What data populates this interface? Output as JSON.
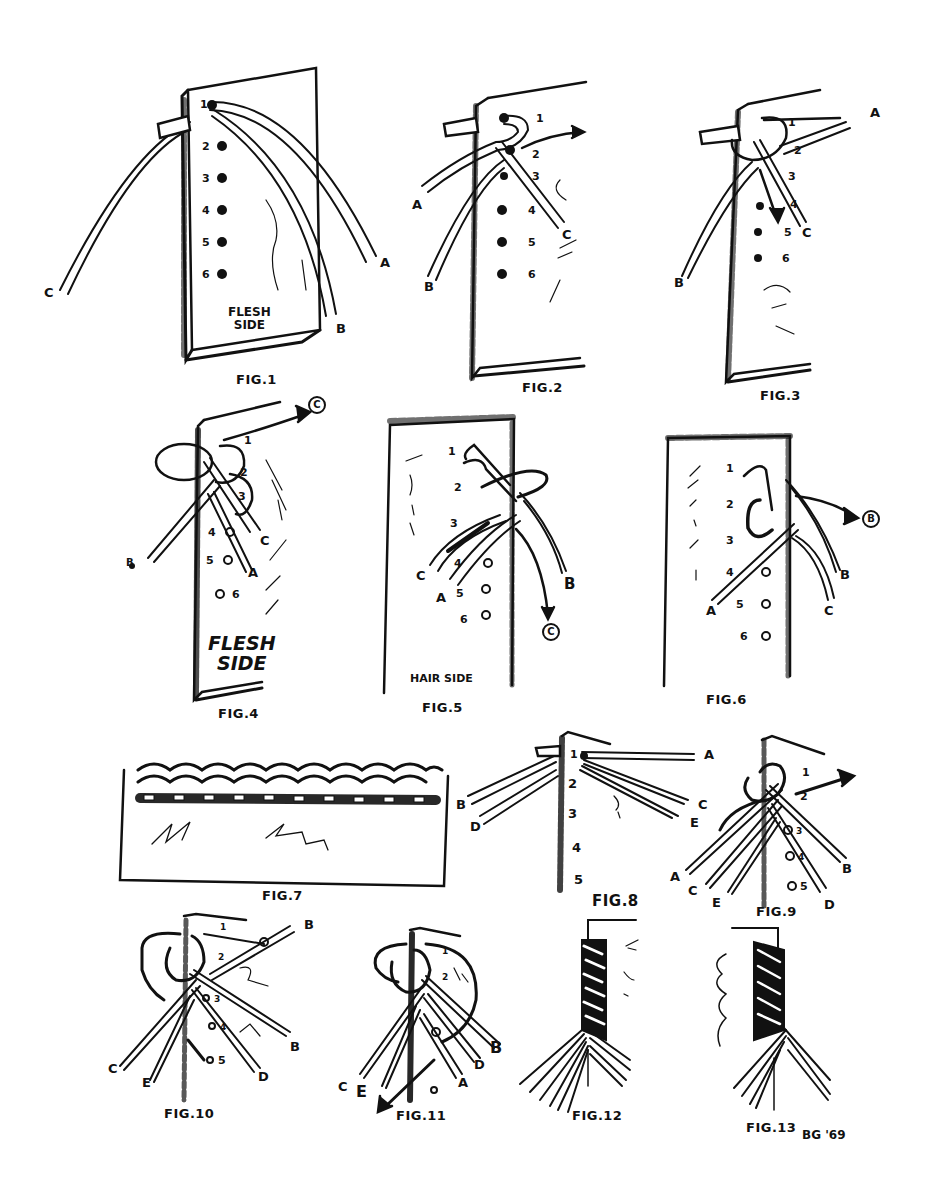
{
  "ink_color": "#111111",
  "paper_color": "#ffffff",
  "signature": "BG '69",
  "figures": [
    {
      "id": "fig1",
      "caption": "FIG.1",
      "side_label": [
        "FLESH",
        "SIDE"
      ],
      "hole_numbers": [
        "1",
        "2",
        "3",
        "4",
        "5",
        "6"
      ],
      "strand_labels": [
        "A",
        "B",
        "C"
      ]
    },
    {
      "id": "fig2",
      "caption": "FIG.2",
      "hole_numbers": [
        "1",
        "2",
        "3",
        "4",
        "5",
        "6"
      ],
      "strand_labels": [
        "A",
        "B",
        "C"
      ]
    },
    {
      "id": "fig3",
      "caption": "FIG.3",
      "hole_numbers": [
        "1",
        "2",
        "3",
        "4",
        "5",
        "6"
      ],
      "strand_labels": [
        "A",
        "B",
        "C"
      ]
    },
    {
      "id": "fig4",
      "caption": "FIG.4",
      "side_label": [
        "FLESH",
        "SIDE"
      ],
      "hole_numbers": [
        "1",
        "2",
        "3",
        "4",
        "5",
        "6"
      ],
      "strand_labels": [
        "B",
        "C",
        "A"
      ],
      "callout": "C"
    },
    {
      "id": "fig5",
      "caption": "FIG.5",
      "side_label": [
        "HAIR SIDE"
      ],
      "hole_numbers": [
        "1",
        "2",
        "3",
        "4",
        "5",
        "6"
      ],
      "strand_labels": [
        "C",
        "A",
        "B"
      ],
      "callout": "C"
    },
    {
      "id": "fig6",
      "caption": "FIG.6",
      "hole_numbers": [
        "1",
        "2",
        "3",
        "4",
        "5",
        "6"
      ],
      "strand_labels": [
        "A",
        "C",
        "B"
      ],
      "callout": "B"
    },
    {
      "id": "fig7",
      "caption": "FIG.7"
    },
    {
      "id": "fig8",
      "caption": "FIG.8",
      "hole_numbers": [
        "1",
        "2",
        "3",
        "4",
        "5"
      ],
      "strand_labels": [
        "A",
        "B",
        "C",
        "D",
        "E"
      ]
    },
    {
      "id": "fig9",
      "caption": "FIG.9",
      "hole_numbers": [
        "1",
        "2",
        "3",
        "4",
        "5"
      ],
      "strand_labels": [
        "A",
        "C",
        "E",
        "B",
        "D"
      ]
    },
    {
      "id": "fig10",
      "caption": "FIG.10",
      "hole_numbers": [
        "1",
        "2",
        "3",
        "4",
        "5"
      ],
      "strand_labels": [
        "A",
        "B",
        "C",
        "E",
        "D"
      ]
    },
    {
      "id": "fig11",
      "caption": "FIG.11",
      "hole_numbers": [
        "1",
        "2"
      ],
      "strand_labels": [
        "B",
        "C",
        "E",
        "D",
        "A"
      ]
    },
    {
      "id": "fig12",
      "caption": "FIG.12"
    },
    {
      "id": "fig13",
      "caption": "FIG.13"
    }
  ]
}
